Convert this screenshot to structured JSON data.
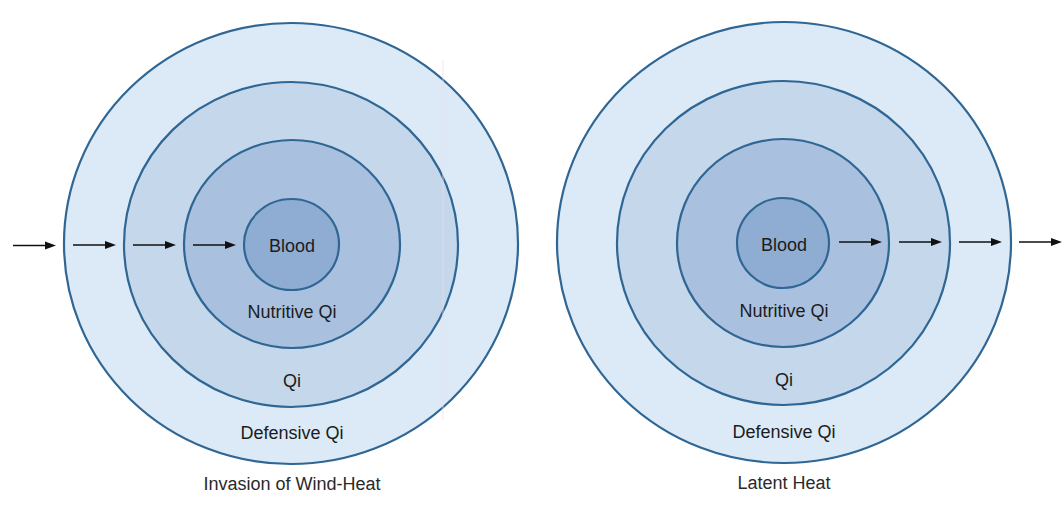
{
  "colors": {
    "outer": "#dbeaf6",
    "second": "#c4d7eb",
    "third": "#a9c1de",
    "inner": "#8fadd3",
    "stroke": "#2f6694",
    "arrow": "#111111"
  },
  "diagrams": [
    {
      "id": "left",
      "title": "Invasion of Wind-Heat",
      "labels": {
        "blood": "Blood",
        "nutritive_qi": "Nutritive Qi",
        "qi": "Qi",
        "defensive_qi": "Defensive Qi"
      },
      "arrow_direction": "inward",
      "arrow_count": 4
    },
    {
      "id": "right",
      "title": "Latent Heat",
      "labels": {
        "blood": "Blood",
        "nutritive_qi": "Nutritive Qi",
        "qi": "Qi",
        "defensive_qi": "Defensive Qi"
      },
      "arrow_direction": "outward",
      "arrow_count": 4
    }
  ]
}
